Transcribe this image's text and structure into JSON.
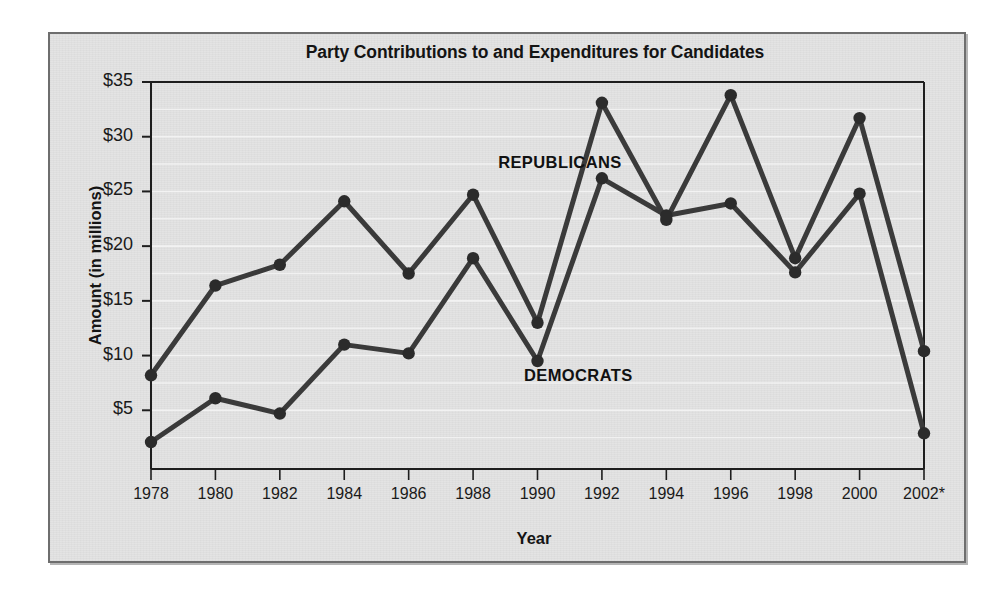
{
  "chart_data": {
    "type": "line",
    "title": "Party Contributions to and Expenditures for Candidates",
    "xlabel": "Year",
    "ylabel": "Amount (in millions)",
    "x": [
      "1978",
      "1980",
      "1982",
      "1984",
      "1986",
      "1988",
      "1990",
      "1992",
      "1994",
      "1996",
      "1998",
      "2000",
      "2002*"
    ],
    "categories": [
      "1978",
      "1980",
      "1982",
      "1984",
      "1986",
      "1988",
      "1990",
      "1992",
      "1994",
      "1996",
      "1998",
      "2000",
      "2002*"
    ],
    "series": [
      {
        "name": "REPUBLICANS",
        "values": [
          8.2,
          16.4,
          18.3,
          24.1,
          17.5,
          24.7,
          13.0,
          33.1,
          22.4,
          33.8,
          18.9,
          31.7,
          10.4
        ]
      },
      {
        "name": "DEMOCRATS",
        "values": [
          2.1,
          6.1,
          4.7,
          11.0,
          10.2,
          18.9,
          9.5,
          26.2,
          22.8,
          23.9,
          17.6,
          24.8,
          2.9
        ]
      }
    ],
    "ytick_labels": [
      "$35",
      "$30",
      "$25",
      "$20",
      "$15",
      "$10",
      "$5"
    ],
    "ytick_values": [
      35,
      30,
      25,
      20,
      15,
      10,
      5
    ],
    "ylim": [
      0,
      35
    ],
    "xlim_index": [
      0,
      12
    ],
    "grid": "horizontal",
    "grid_color": "#f4f4f4",
    "legend_position": "inline-annotations",
    "line_color": "#3a3a3a",
    "marker_color": "#2b2b2b",
    "plot_background": "#e3e3e3",
    "annotations": [
      {
        "text": "REPUBLICANS",
        "x_index": 6.6,
        "y_value": 27.6
      },
      {
        "text": "DEMOCRATS",
        "x_index": 7.0,
        "y_value": 8.1
      }
    ]
  }
}
